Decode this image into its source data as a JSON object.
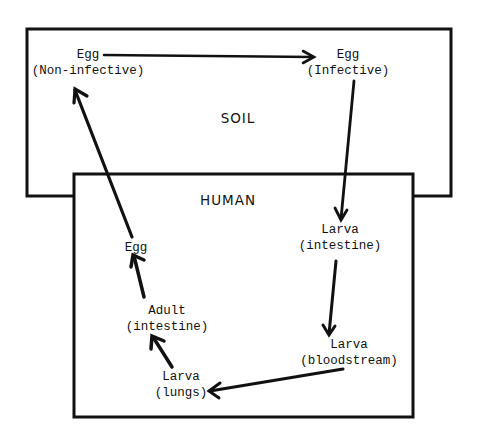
{
  "diagram": {
    "regions": {
      "soil": {
        "label": "SOIL"
      },
      "human": {
        "label": "HUMAN"
      }
    },
    "nodes": {
      "egg_noninfective": {
        "line1": "Egg",
        "line2": "(Non-infective)"
      },
      "egg_infective": {
        "line1": "Egg",
        "line2": "(Infective)"
      },
      "larva_intestine": {
        "line1": "Larva",
        "line2": "(intestine)"
      },
      "larva_bloodstream": {
        "line1": "Larva",
        "line2": "(bloodstream)"
      },
      "larva_lungs": {
        "line1": "Larva",
        "line2": "(lungs)"
      },
      "adult_intestine": {
        "line1": "Adult",
        "line2": "(intestine)"
      },
      "egg_human": {
        "line1": "Egg"
      }
    },
    "edges": [
      {
        "from": "Egg (Non-infective)",
        "to": "Egg (Infective)"
      },
      {
        "from": "Egg (Infective)",
        "to": "Larva (intestine)"
      },
      {
        "from": "Larva (intestine)",
        "to": "Larva (bloodstream)"
      },
      {
        "from": "Larva (bloodstream)",
        "to": "Larva (lungs)"
      },
      {
        "from": "Larva (lungs)",
        "to": "Adult (intestine)"
      },
      {
        "from": "Adult (intestine)",
        "to": "Egg"
      },
      {
        "from": "Egg",
        "to": "Egg (Non-infective)"
      }
    ],
    "colors": {
      "ink": "#111111",
      "background": "#ffffff"
    }
  }
}
